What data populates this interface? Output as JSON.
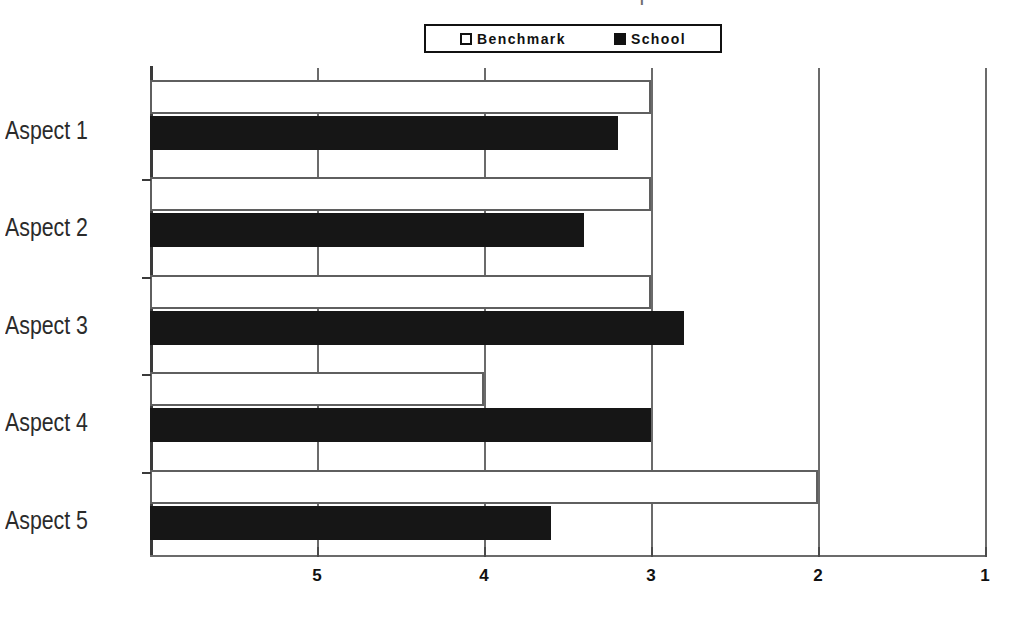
{
  "title_remnant": "' |",
  "legend": {
    "position": "top-center",
    "entries": [
      {
        "label": "Benchmark",
        "swatch": "hollow-square-icon",
        "color": "#ffffff"
      },
      {
        "label": "School",
        "swatch": "filled-square-icon",
        "color": "#111111"
      }
    ]
  },
  "axes": {
    "x_tick_labels": [
      "5",
      "4",
      "3",
      "2",
      "1"
    ],
    "x_tick_values": [
      5,
      4,
      3,
      2,
      1
    ],
    "y_tick_labels": [
      "Aspect 1",
      "Aspect 2",
      "Aspect 3",
      "Aspect 4",
      "Aspect 5"
    ]
  },
  "chart_data": {
    "type": "bar",
    "orientation": "horizontal",
    "title": "",
    "subtitle": "",
    "xlabel": "",
    "ylabel": "",
    "categories": [
      "Aspect 1",
      "Aspect 2",
      "Aspect 3",
      "Aspect 4",
      "Aspect 5"
    ],
    "series": [
      {
        "name": "Benchmark",
        "color": "#ffffff",
        "values": [
          3.0,
          3.0,
          3.0,
          4.0,
          2.0
        ]
      },
      {
        "name": "School",
        "color": "#111111",
        "values": [
          3.2,
          3.4,
          2.8,
          3.0,
          3.6
        ]
      }
    ],
    "xlim": [
      6.0,
      1.0
    ],
    "x_reversed": true,
    "x_ticks": [
      5,
      4,
      3,
      2,
      1
    ],
    "grid": "vertical",
    "legend_position": "top-center"
  }
}
